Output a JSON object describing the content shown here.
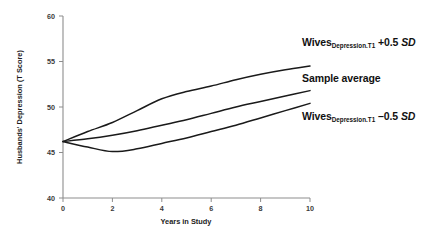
{
  "chart_data": {
    "type": "line",
    "title": "",
    "xlabel": "Years in Study",
    "ylabel": "Husbands' Depression (T Score)",
    "xlim": [
      0,
      10
    ],
    "ylim": [
      40,
      60
    ],
    "xticks": [
      0,
      2,
      4,
      6,
      8,
      10
    ],
    "yticks": [
      40,
      45,
      50,
      55,
      60
    ],
    "grid": false,
    "legend": "inline-annotations-right",
    "x": [
      0,
      1,
      2,
      3,
      4,
      5,
      6,
      7,
      8,
      9,
      10
    ],
    "series": [
      {
        "name": "Wives Depression.T1 +0.5 SD",
        "values": [
          46.2,
          47.3,
          48.3,
          49.6,
          50.9,
          51.7,
          52.3,
          53.0,
          53.6,
          54.1,
          54.5
        ]
      },
      {
        "name": "Sample average",
        "values": [
          46.2,
          46.5,
          46.9,
          47.4,
          48.0,
          48.6,
          49.3,
          50.0,
          50.6,
          51.2,
          51.8
        ]
      },
      {
        "name": "Wives Depression.T1 -0.5 SD",
        "values": [
          46.2,
          45.6,
          45.1,
          45.4,
          46.0,
          46.6,
          47.3,
          48.0,
          48.8,
          49.6,
          50.4
        ]
      }
    ]
  },
  "annotations": {
    "top": {
      "base": "Wives",
      "subscript": "Depression.T1",
      "value": "+0.5",
      "unit": "SD"
    },
    "middle": {
      "base": "Sample average",
      "subscript": "",
      "value": "",
      "unit": ""
    },
    "bottom": {
      "base": "Wives",
      "subscript": "Depression.T1",
      "value": "–0.5",
      "unit": "SD"
    }
  },
  "axes": {
    "y_title": "Husbands' Depression (T Score)",
    "x_title": "Years in Study",
    "y_tick_labels": [
      "60",
      "55",
      "50",
      "45",
      "40"
    ],
    "x_tick_labels": [
      "0",
      "2",
      "4",
      "6",
      "8",
      "10"
    ]
  }
}
